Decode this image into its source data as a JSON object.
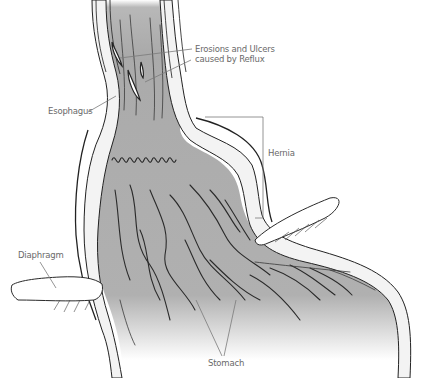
{
  "figure": {
    "labels": {
      "erosions_line1": "Erosions and Ulcers",
      "erosions_line2": "caused by Reflux",
      "esophagus": "Esophagus",
      "hernia": "Hernia",
      "diaphragm": "Diaphragm",
      "stomach": "Stomach"
    },
    "colors": {
      "tissue_fill": "#a9a9a9",
      "wall_fill": "#f2f2f2",
      "ink": "#222222",
      "label_text": "#6a6a6a"
    }
  }
}
